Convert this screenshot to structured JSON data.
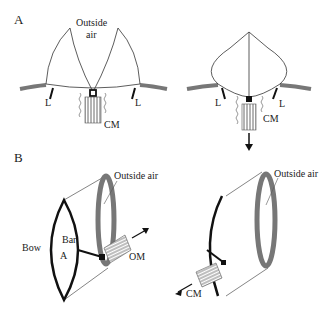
{
  "panels": {
    "a": {
      "label": "A",
      "outside_air": [
        "Outside",
        "air"
      ],
      "left": {
        "l_left": "L",
        "l_right": "L",
        "cm": "CM"
      },
      "right": {
        "l_left": "L",
        "l_right": "L",
        "cm": "CM"
      }
    },
    "b": {
      "label": "B",
      "left": {
        "outside_air": "Outside air",
        "bow": "Bow",
        "bar": "Bar",
        "a": "A",
        "om": "OM"
      },
      "right": {
        "outside_air": "Outside air",
        "cm": "CM"
      }
    }
  },
  "colors": {
    "membrane": "#777777",
    "line": "#111111",
    "fill_gray": "#888888"
  }
}
